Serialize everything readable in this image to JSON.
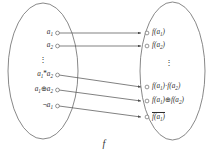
{
  "figure": {
    "name": "homomorphism-mapping-diagram",
    "function_label": "f",
    "caption": "",
    "colors": {
      "stroke": "#555555",
      "text": "#2b2b2b",
      "background": "#ffffff",
      "caption": "#d8d8d8"
    },
    "left_set": {
      "items": [
        {
          "label_html": "a<sub>1</sub>",
          "y": 33
        },
        {
          "label_html": "a<sub>2</sub>",
          "y": 46
        },
        {
          "label_html": "a<sub>1</sub><span class=\"op\">*</span>a<sub>2</sub>",
          "y": 75
        },
        {
          "label_html": "a<sub>1</sub><span class=\"op\">⊕</span>a<sub>2</sub>",
          "y": 90
        },
        {
          "label_html": "<span class=\"op\">¬</span>a<sub>1</sub>",
          "y": 106
        }
      ],
      "ellipsis": "⋮"
    },
    "right_set": {
      "items": [
        {
          "label_html": "f(a<sub>1</sub>)",
          "y": 33
        },
        {
          "label_html": "f(a<sub>2</sub>)",
          "y": 46
        },
        {
          "label_html": "f(a<sub>1</sub>)<span class=\"op\">·</span>f(a<sub>2</sub>)",
          "y": 87
        },
        {
          "label_html": "f(a<sub>1</sub>)<span class=\"op\">⊕</span>f(a<sub>2</sub>)",
          "y": 101
        },
        {
          "label_html": "<span class=\"ovl\">f(a<sub>1</sub>)</span>",
          "y": 117
        }
      ],
      "ellipsis": "⋮"
    },
    "arrows": [
      {
        "from_y": 33,
        "to_y": 33
      },
      {
        "from_y": 46,
        "to_y": 46
      },
      {
        "from_y": 75,
        "to_y": 87
      },
      {
        "from_y": 90,
        "to_y": 101
      },
      {
        "from_y": 106,
        "to_y": 117
      }
    ]
  }
}
